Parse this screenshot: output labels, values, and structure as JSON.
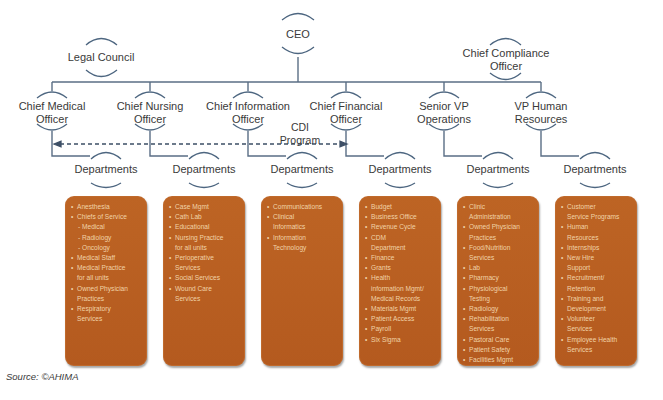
{
  "diagram": {
    "type": "org-chart",
    "top": {
      "ceo": {
        "label": "CEO"
      },
      "legal": {
        "label": "Legal Council"
      },
      "compliance": {
        "line1": "Chief Compliance",
        "line2": "Officer"
      }
    },
    "officers": [
      {
        "line1": "Chief Medical",
        "line2": "Officer"
      },
      {
        "line1": "Chief Nursing",
        "line2": "Officer"
      },
      {
        "line1": "Chief Information",
        "line2": "Officer"
      },
      {
        "line1": "Chief Financial",
        "line2": "Officer"
      },
      {
        "line1": "Senior VP",
        "line2": "Operations"
      },
      {
        "line1": "VP Human",
        "line2": "Resources"
      }
    ],
    "cdi_program": {
      "line1": "CDI",
      "line2": "Program"
    },
    "departments_label": "Departments",
    "departments": [
      {
        "items": [
          {
            "text": "Anesthesia"
          },
          {
            "text": "Chiefs of Service"
          },
          {
            "text": "- Medical",
            "sub": true
          },
          {
            "text": "- Radiology",
            "sub": true
          },
          {
            "text": "- Oncology",
            "sub": true
          },
          {
            "text": "Medical Staff"
          },
          {
            "text": "Medical Practice",
            "cont": "for all units"
          },
          {
            "text": "Owned Physician",
            "cont": "Practices"
          },
          {
            "text": "Respiratory",
            "cont": "Services"
          }
        ]
      },
      {
        "items": [
          {
            "text": "Case Mgmt"
          },
          {
            "text": "Cath Lab"
          },
          {
            "text": "Educational"
          },
          {
            "text": "Nursing Practice",
            "cont": "for all units"
          },
          {
            "text": "Perioperative",
            "cont": "Services"
          },
          {
            "text": "Social Services"
          },
          {
            "text": "Wound Care",
            "cont": "Services"
          }
        ]
      },
      {
        "items": [
          {
            "text": "Communications"
          },
          {
            "text": "Clinical",
            "cont": "Informatics"
          },
          {
            "text": "Information",
            "cont": "Technology"
          }
        ]
      },
      {
        "items": [
          {
            "text": "Budget"
          },
          {
            "text": "Business Office"
          },
          {
            "text": "Revenue Cycle"
          },
          {
            "text": "CDM",
            "cont": "Department"
          },
          {
            "text": "Finance"
          },
          {
            "text": "Grants"
          },
          {
            "text": "Health",
            "cont": "information Mgmt/",
            "cont2": "Medical Records"
          },
          {
            "text": "Materials Mgmt"
          },
          {
            "text": "Patient Access"
          },
          {
            "text": "Payroll"
          },
          {
            "text": "Six Sigma"
          }
        ]
      },
      {
        "items": [
          {
            "text": "Clinic",
            "cont": "Administration"
          },
          {
            "text": "Owned Physician",
            "cont": "Practices"
          },
          {
            "text": "Food/Nutrition",
            "cont": "Services"
          },
          {
            "text": "Lab"
          },
          {
            "text": "Pharmacy"
          },
          {
            "text": "Physiological",
            "cont": "Testing"
          },
          {
            "text": "Radiology"
          },
          {
            "text": "Rehabilitation",
            "cont": "Services"
          },
          {
            "text": "Pastoral Care"
          },
          {
            "text": "Patient Safety"
          },
          {
            "text": "Facilities Mgmt"
          }
        ]
      },
      {
        "items": [
          {
            "text": "Customer",
            "cont": "Service Programs"
          },
          {
            "text": "Human",
            "cont": "Resources"
          },
          {
            "text": "Internships"
          },
          {
            "text": "New Hire",
            "cont": "Support"
          },
          {
            "text": "Recruitment/",
            "cont": "Retention"
          },
          {
            "text": "Training and",
            "cont": "Development"
          },
          {
            "text": "Volunteer",
            "cont": "Services"
          },
          {
            "text": "Employee Health",
            "cont": "Services"
          }
        ]
      }
    ],
    "colors": {
      "box_fill": "#b85f22",
      "box_text": "#f1d3a8",
      "line": "#5a6e85",
      "arc": "#4d6680"
    }
  },
  "source": "Source: ©AHIMA"
}
